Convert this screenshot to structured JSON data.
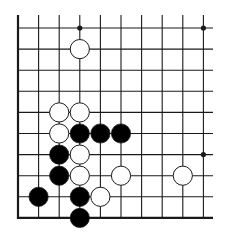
{
  "diagram": {
    "type": "go-board-fragment",
    "columns": 10,
    "rows": 10,
    "edges": [
      "left",
      "bottom"
    ],
    "open_edges": [
      "top",
      "right"
    ],
    "colors": {
      "line": "#1a1a1a",
      "black_stone": "#000000",
      "white_stone": "#ffffff",
      "stone_outline": "#1a1a1a"
    },
    "hoshi": [
      {
        "col": 3,
        "row": 0
      },
      {
        "col": 9,
        "row": 0
      },
      {
        "col": 9,
        "row": 6
      }
    ],
    "stones": [
      {
        "color": "white",
        "col": 3,
        "row": 1
      },
      {
        "color": "white",
        "col": 2,
        "row": 4
      },
      {
        "color": "white",
        "col": 3,
        "row": 4
      },
      {
        "color": "white",
        "col": 2,
        "row": 5
      },
      {
        "color": "black",
        "col": 3,
        "row": 5
      },
      {
        "color": "black",
        "col": 4,
        "row": 5
      },
      {
        "color": "black",
        "col": 5,
        "row": 5
      },
      {
        "color": "black",
        "col": 2,
        "row": 6
      },
      {
        "color": "white",
        "col": 3,
        "row": 6
      },
      {
        "color": "black",
        "col": 2,
        "row": 7
      },
      {
        "color": "white",
        "col": 3,
        "row": 7
      },
      {
        "color": "white",
        "col": 5,
        "row": 7
      },
      {
        "color": "white",
        "col": 8,
        "row": 7
      },
      {
        "color": "black",
        "col": 1,
        "row": 8
      },
      {
        "color": "black",
        "col": 3,
        "row": 8
      },
      {
        "color": "white",
        "col": 4,
        "row": 8
      },
      {
        "color": "black",
        "col": 3,
        "row": 9
      }
    ]
  }
}
